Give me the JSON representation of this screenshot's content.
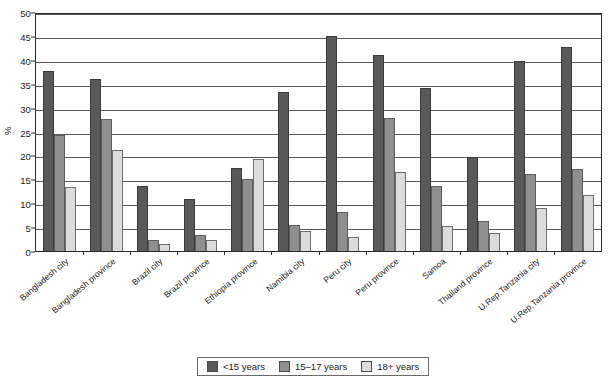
{
  "chart_data": {
    "type": "bar",
    "title": "",
    "subtitle": "",
    "xlabel": "",
    "ylabel": "%",
    "ylim": [
      0,
      50
    ],
    "ytick_step": 5,
    "yticks": [
      0,
      5,
      10,
      15,
      20,
      25,
      30,
      35,
      40,
      45,
      50
    ],
    "grid": true,
    "legend_position": "bottom-center",
    "orientation": "vertical",
    "grouping": "grouped",
    "categories": [
      "Bangladesh city",
      "Bangladesh province",
      "Brazil city",
      "Brazil province",
      "Ethiopia province",
      "Namibia city",
      "Peru city",
      "Peru province",
      "Samoa",
      "Thailand province",
      "U.Rep.Tanzania city",
      "U.Rep.Tanzania province"
    ],
    "series": [
      {
        "name": "<15 years",
        "color": "#595959",
        "values": [
          37.7,
          35.9,
          13.6,
          10.8,
          17.4,
          33.3,
          44.9,
          41.0,
          34.0,
          19.6,
          39.8,
          42.6
        ]
      },
      {
        "name": "15–17 years",
        "color": "#8f8f8f",
        "values": [
          24.3,
          27.6,
          2.2,
          3.3,
          15.1,
          5.5,
          8.1,
          27.9,
          13.5,
          6.3,
          16.2,
          17.2
        ]
      },
      {
        "name": "18+ years",
        "color": "#dcdcdc",
        "values": [
          13.4,
          21.2,
          1.5,
          2.3,
          19.2,
          4.1,
          2.9,
          16.5,
          5.2,
          3.7,
          9.0,
          11.7
        ]
      }
    ]
  },
  "legend": {
    "items": [
      {
        "label": "<15 years",
        "swatch": "s0"
      },
      {
        "label": "15–17 years",
        "swatch": "s1"
      },
      {
        "label": "18+ years",
        "swatch": "s2"
      }
    ]
  }
}
